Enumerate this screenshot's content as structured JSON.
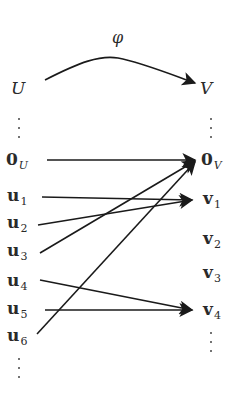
{
  "diagram": {
    "map_label": "φ",
    "domain_label": "U",
    "codomain_label": "V",
    "ellipsis": "⋮",
    "left_nodes": [
      {
        "id": "0U",
        "base": "0",
        "sub": "U",
        "sub_italic": true
      },
      {
        "id": "u1",
        "base": "u",
        "sub": "1"
      },
      {
        "id": "u2",
        "base": "u",
        "sub": "2"
      },
      {
        "id": "u3",
        "base": "u",
        "sub": "3"
      },
      {
        "id": "u4",
        "base": "u",
        "sub": "4"
      },
      {
        "id": "u5",
        "base": "u",
        "sub": "5"
      },
      {
        "id": "u6",
        "base": "u",
        "sub": "6"
      }
    ],
    "right_nodes": [
      {
        "id": "0V",
        "base": "0",
        "sub": "V",
        "sub_italic": true
      },
      {
        "id": "v1",
        "base": "v",
        "sub": "1"
      },
      {
        "id": "v2",
        "base": "v",
        "sub": "2"
      },
      {
        "id": "v3",
        "base": "v",
        "sub": "3"
      },
      {
        "id": "v4",
        "base": "v",
        "sub": "4"
      }
    ],
    "edges": [
      {
        "from": "0U",
        "to": "0V"
      },
      {
        "from": "u1",
        "to": "v1"
      },
      {
        "from": "u2",
        "to": "v1"
      },
      {
        "from": "u3",
        "to": "0V"
      },
      {
        "from": "u4",
        "to": "v4"
      },
      {
        "from": "u5",
        "to": "v4"
      },
      {
        "from": "u6",
        "to": "0V"
      }
    ],
    "colors": {
      "stroke": "#1a1a1a",
      "text": "#2a2a2a"
    }
  }
}
